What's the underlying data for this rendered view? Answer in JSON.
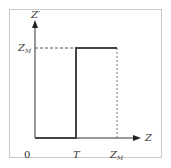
{
  "diagram": {
    "y_axis_label": "Z′",
    "x_axis_label": "Z",
    "origin_label": "0",
    "x_ticks": [
      {
        "label": "T",
        "sub": ""
      },
      {
        "label": "Z",
        "sub": "M"
      }
    ],
    "y_ticks": [
      {
        "label": "Z",
        "sub": "M"
      }
    ],
    "colors": {
      "line": "#444444",
      "axis": "#333333",
      "dashed": "#555555",
      "frame": "#c8c8c8"
    }
  }
}
